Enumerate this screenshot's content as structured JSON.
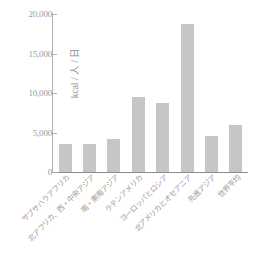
{
  "chart_data": {
    "type": "bar",
    "title": "",
    "subtitle": "",
    "xlabel": "",
    "ylabel": "kcal / 人 / 日",
    "ylim": [
      0,
      20000
    ],
    "ytick_values": [
      0,
      5000,
      10000,
      15000,
      20000
    ],
    "ytick_labels": [
      "0",
      "5,000",
      "10,000",
      "15,000",
      "20,000"
    ],
    "grid": false,
    "legend": false,
    "bar_color": "#c6c6c6",
    "axis_color": "#8c8c8c",
    "text_color": "#9a9a9a",
    "categories": [
      "サブサハラアフリカ",
      "北アフリカ、西・中央アジア",
      "南・東南アジア",
      "ラテンアメリカ",
      "ヨーロッパとロシア",
      "北アメリカとオセアニア",
      "先進アジア",
      "世界平均"
    ],
    "values": [
      3500,
      3600,
      4200,
      9500,
      8700,
      18700,
      4500,
      6000
    ]
  }
}
